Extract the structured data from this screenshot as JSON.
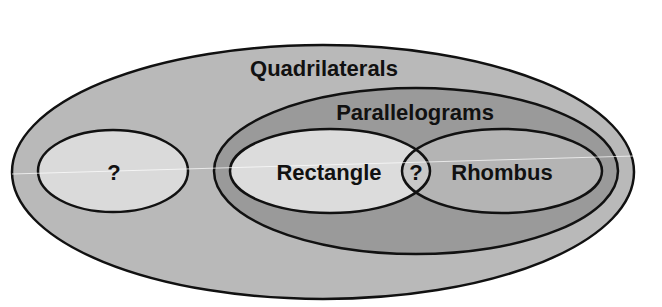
{
  "diagram": {
    "type": "venn",
    "colors": {
      "background": "#ffffff",
      "quadrilaterals_fill": "#b9b9b9",
      "parallelograms_fill": "#9a9a9a",
      "rectangle_fill": "#dcdcdc",
      "rhombus_fill": "#b4b4b4",
      "unknown_fill": "#dadada",
      "stroke": "#111111"
    },
    "sets": [
      {
        "id": "quadrilaterals",
        "label": "Quadrilaterals"
      },
      {
        "id": "parallelograms",
        "label": "Parallelograms",
        "parent": "quadrilaterals"
      },
      {
        "id": "unknown-set",
        "label": "?",
        "parent": "quadrilaterals"
      },
      {
        "id": "rectangle",
        "label": "Rectangle",
        "parent": "parallelograms"
      },
      {
        "id": "rhombus",
        "label": "Rhombus",
        "parent": "parallelograms"
      }
    ],
    "intersection": {
      "sets": [
        "rectangle",
        "rhombus"
      ],
      "label": "?"
    }
  }
}
